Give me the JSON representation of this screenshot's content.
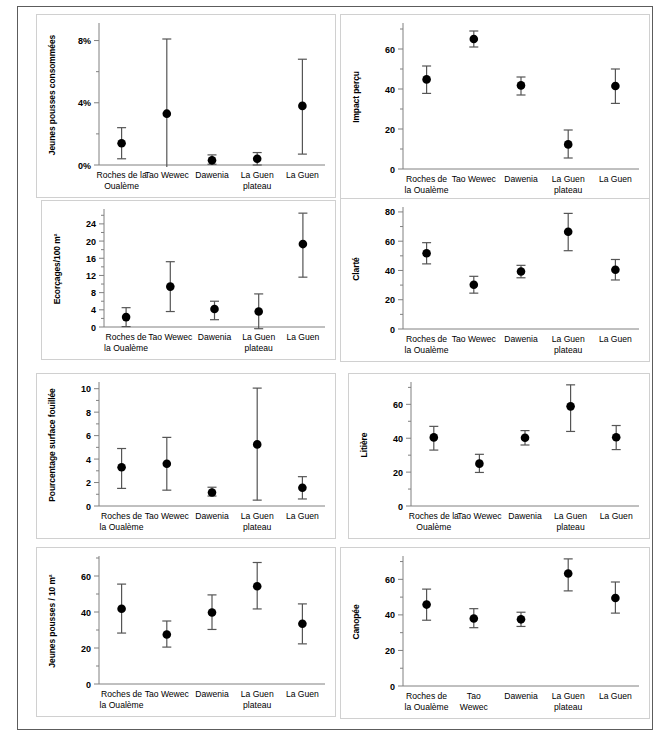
{
  "figure": {
    "title": "",
    "panel_count": 8,
    "categories": [
      "Roches de la Oualème",
      "Tao Wewec",
      "Dawenia",
      "La Guen plateau",
      "La Guen"
    ]
  },
  "chart_data": [
    {
      "type": "scatter",
      "panel_id": "jeunes-pousses-consommees",
      "title": "",
      "xlabel": "",
      "ylabel": "Jeunes pousses consommées",
      "ylim": [
        0,
        9
      ],
      "yticks": [
        0,
        4,
        8
      ],
      "ytick_labels": [
        "0%",
        "4%",
        "8%"
      ],
      "minor_yticks": [
        2,
        6
      ],
      "grid": false,
      "categories": [
        "Roches de la Oualème",
        "Tao Wewec",
        "Dawenia",
        "La Guen plateau",
        "La Guen"
      ],
      "category_lines": [
        [
          "Roches de la",
          "Oualème"
        ],
        [
          "Tao Wewec"
        ],
        [
          "Dawenia"
        ],
        [
          "La Guen",
          "plateau"
        ],
        [
          "La Guen"
        ]
      ],
      "values": [
        1.4,
        3.3,
        0.3,
        0.4,
        3.8
      ],
      "err_low": [
        0.4,
        -0.6,
        0.05,
        0.0,
        0.7
      ],
      "err_high": [
        2.4,
        8.1,
        0.65,
        0.8,
        6.8
      ]
    },
    {
      "type": "scatter",
      "panel_id": "impact-percu",
      "title": "",
      "xlabel": "",
      "ylabel": "Impact perçu",
      "ylim": [
        0,
        72
      ],
      "yticks": [
        0,
        20,
        40,
        60
      ],
      "ytick_labels": [
        "0",
        "20",
        "40",
        "60"
      ],
      "minor_yticks": [
        10,
        30,
        50,
        70
      ],
      "grid": false,
      "categories": [
        "Roches de la Oualème",
        "Tao Wewec",
        "Dawenia",
        "La Guen plateau",
        "La Guen"
      ],
      "category_lines": [
        [
          "Roches de",
          "la Oualème"
        ],
        [
          "Tao Wewec"
        ],
        [
          "Dawenia"
        ],
        [
          "La Guen",
          "plateau"
        ],
        [
          "La Guen"
        ]
      ],
      "values": [
        44.8,
        65.0,
        41.8,
        12.3,
        41.5
      ],
      "err_low": [
        37.8,
        61.0,
        37.0,
        5.5,
        32.8
      ],
      "err_high": [
        51.5,
        69.0,
        46.0,
        19.5,
        50.0
      ]
    },
    {
      "type": "scatter",
      "panel_id": "ecorcages",
      "title": "",
      "xlabel": "",
      "ylabel": "Ecorçages/100 m²",
      "ylim": [
        0,
        27
      ],
      "yticks": [
        0,
        4,
        8,
        12,
        16,
        20,
        24
      ],
      "ytick_labels": [
        "0",
        "4",
        "8",
        "12",
        "16",
        "20",
        "24"
      ],
      "minor_yticks": [
        2,
        6,
        10,
        14,
        18,
        22,
        26
      ],
      "grid": false,
      "categories": [
        "Roches de la Oualème",
        "Tao Wewec",
        "Dawenia",
        "La Guen plateau",
        "La Guen"
      ],
      "category_lines": [
        [
          "Roches de",
          "la Oualème"
        ],
        [
          "Tao Wewec"
        ],
        [
          "Dawenia"
        ],
        [
          "La Guen",
          "plateau"
        ],
        [
          "La Guen"
        ]
      ],
      "values": [
        2.3,
        9.4,
        4.2,
        3.6,
        19.3
      ],
      "err_low": [
        0.1,
        3.6,
        1.7,
        -0.4,
        11.6
      ],
      "err_high": [
        4.5,
        15.2,
        6.0,
        7.7,
        26.5
      ]
    },
    {
      "type": "scatter",
      "panel_id": "clarte",
      "title": "",
      "xlabel": "",
      "ylabel": "Clarté",
      "ylim": [
        0,
        82
      ],
      "yticks": [
        0,
        20,
        40,
        60,
        80
      ],
      "ytick_labels": [
        "0",
        "20",
        "40",
        "60",
        "80"
      ],
      "minor_yticks": [
        10,
        30,
        50,
        70
      ],
      "grid": false,
      "categories": [
        "Roches de la Oualème",
        "Tao Wewec",
        "Dawenia",
        "La Guen plateau",
        "La Guen"
      ],
      "category_lines": [
        [
          "Roches de",
          "la Oualème"
        ],
        [
          "Tao Wewec"
        ],
        [
          "Dawenia"
        ],
        [
          "La Guen",
          "plateau"
        ],
        [
          "La Guen"
        ]
      ],
      "values": [
        51.8,
        30.2,
        39.3,
        66.5,
        40.5
      ],
      "err_low": [
        44.5,
        24.5,
        35.0,
        53.5,
        33.5
      ],
      "err_high": [
        59.0,
        36.0,
        43.5,
        79.0,
        47.5
      ]
    },
    {
      "type": "scatter",
      "panel_id": "pourcentage-surface-fouillee",
      "title": "",
      "xlabel": "",
      "ylabel": "Pourcentage surface fouillée",
      "ylim": [
        0,
        10.4
      ],
      "yticks": [
        0,
        2,
        4,
        6,
        8,
        10
      ],
      "ytick_labels": [
        "0",
        "2",
        "4",
        "6",
        "8",
        "10"
      ],
      "minor_yticks": [
        1,
        3,
        5,
        7,
        9
      ],
      "grid": false,
      "categories": [
        "Roches de la Oualème",
        "Tao Wewec",
        "Dawenia",
        "La Guen plateau",
        "La Guen"
      ],
      "category_lines": [
        [
          "Roches de",
          "la Oualème"
        ],
        [
          "Tao Wewec"
        ],
        [
          "Dawenia"
        ],
        [
          "La Guen",
          "plateau"
        ],
        [
          "La Guen"
        ]
      ],
      "values": [
        3.3,
        3.6,
        1.15,
        5.25,
        1.55
      ],
      "err_low": [
        1.5,
        1.35,
        0.85,
        0.5,
        0.6
      ],
      "err_high": [
        4.9,
        5.85,
        1.6,
        10.05,
        2.5
      ]
    },
    {
      "type": "scatter",
      "panel_id": "litiere",
      "title": "",
      "xlabel": "",
      "ylabel": "Litière",
      "ylim": [
        0,
        72
      ],
      "yticks": [
        0,
        20,
        40,
        60
      ],
      "ytick_labels": [
        "0",
        "20",
        "40",
        "60"
      ],
      "minor_yticks": [
        10,
        30,
        50,
        70
      ],
      "grid": false,
      "categories": [
        "Roches de la Oualème",
        "Tao Wewec",
        "Dawenia",
        "La Guen plateau",
        "La Guen"
      ],
      "category_lines": [
        [
          "Roches de la",
          "Oualème"
        ],
        [
          "Tao Wewec"
        ],
        [
          "Dawenia"
        ],
        [
          "La Guen",
          "plateau"
        ],
        [
          "La Guen"
        ]
      ],
      "values": [
        40.5,
        25.0,
        40.3,
        58.8,
        40.6
      ],
      "err_low": [
        33.0,
        19.8,
        36.0,
        44.0,
        33.3
      ],
      "err_high": [
        47.0,
        30.5,
        44.5,
        71.5,
        47.5
      ]
    },
    {
      "type": "scatter",
      "panel_id": "jeunes-pousses-10m2",
      "title": "",
      "xlabel": "",
      "ylabel": "Jeunes pousses / 10 m²",
      "ylim": [
        0,
        70
      ],
      "yticks": [
        0,
        20,
        40,
        60
      ],
      "ytick_labels": [
        "0",
        "20",
        "40",
        "60"
      ],
      "minor_yticks": [
        10,
        30,
        50,
        70
      ],
      "grid": false,
      "categories": [
        "Roches de la Oualème",
        "Tao Wewec",
        "Dawenia",
        "La Guen plateau",
        "La Guen"
      ],
      "category_lines": [
        [
          "Roches de",
          "la Oualème"
        ],
        [
          "Tao Wewec"
        ],
        [
          "Dawenia"
        ],
        [
          "La Guen",
          "plateau"
        ],
        [
          "La Guen"
        ]
      ],
      "values": [
        41.8,
        27.5,
        39.7,
        54.3,
        33.5
      ],
      "err_low": [
        28.3,
        20.5,
        30.3,
        41.7,
        22.3
      ],
      "err_high": [
        55.5,
        35.0,
        49.5,
        67.5,
        44.5
      ]
    },
    {
      "type": "scatter",
      "panel_id": "canopee",
      "title": "",
      "xlabel": "",
      "ylabel": "Canopée",
      "ylim": [
        0,
        72
      ],
      "yticks": [
        0,
        20,
        40,
        60
      ],
      "ytick_labels": [
        "0",
        "20",
        "40",
        "60"
      ],
      "minor_yticks": [
        10,
        30,
        50,
        70
      ],
      "grid": false,
      "categories": [
        "Roches de la Oualème",
        "Tao Wewec",
        "Dawenia",
        "La Guen plateau",
        "La Guen"
      ],
      "category_lines": [
        [
          "Roches de",
          "la Oualème"
        ],
        [
          "Tao",
          "Wewec"
        ],
        [
          "Dawenia"
        ],
        [
          "La Guen",
          "plateau"
        ],
        [
          "La Guen"
        ]
      ],
      "values": [
        45.8,
        38.0,
        37.5,
        63.3,
        49.5
      ],
      "err_low": [
        37.0,
        32.8,
        33.5,
        53.5,
        41.0
      ],
      "err_high": [
        54.5,
        43.5,
        41.5,
        71.5,
        58.5
      ]
    }
  ],
  "style": {
    "marker_color": "#000000",
    "errorbar_color": "#555555",
    "axis_color": "#808080",
    "panel_border_color": "#d0d0d0",
    "outer_frame_color": "#5c5c5c",
    "background": "#ffffff"
  }
}
